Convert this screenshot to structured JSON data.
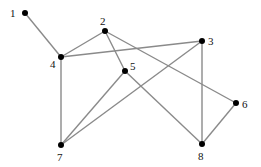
{
  "diagram": {
    "type": "undirected-graph",
    "edge_color": "#8a8a8a",
    "node_color": "#000000",
    "nodes": [
      {
        "id": "1",
        "label": "1",
        "x": 25,
        "y": 13,
        "lx": 10,
        "ly": 17
      },
      {
        "id": "2",
        "label": "2",
        "x": 105,
        "y": 31,
        "lx": 100,
        "ly": 25
      },
      {
        "id": "3",
        "label": "3",
        "x": 202,
        "y": 41,
        "lx": 208,
        "ly": 45
      },
      {
        "id": "4",
        "label": "4",
        "x": 61,
        "y": 57,
        "lx": 50,
        "ly": 68
      },
      {
        "id": "5",
        "label": "5",
        "x": 125,
        "y": 71,
        "lx": 130,
        "ly": 70
      },
      {
        "id": "6",
        "label": "6",
        "x": 236,
        "y": 103,
        "lx": 242,
        "ly": 108
      },
      {
        "id": "7",
        "label": "7",
        "x": 61,
        "y": 145,
        "lx": 57,
        "ly": 161
      },
      {
        "id": "8",
        "label": "8",
        "x": 202,
        "y": 144,
        "lx": 198,
        "ly": 160
      }
    ],
    "edges": [
      [
        "1",
        "4"
      ],
      [
        "2",
        "4"
      ],
      [
        "4",
        "3"
      ],
      [
        "2",
        "5"
      ],
      [
        "2",
        "6"
      ],
      [
        "4",
        "7"
      ],
      [
        "5",
        "7"
      ],
      [
        "5",
        "8"
      ],
      [
        "3",
        "7"
      ],
      [
        "3",
        "8"
      ],
      [
        "6",
        "8"
      ]
    ]
  }
}
